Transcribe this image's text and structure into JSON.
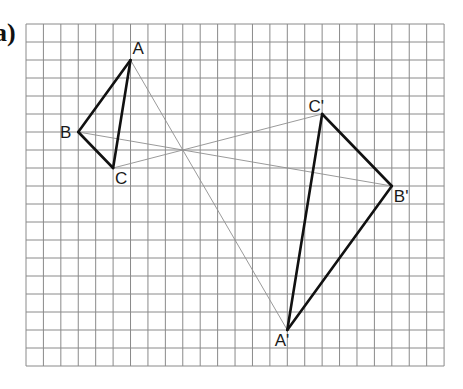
{
  "part_label": "a)",
  "grid": {
    "columns": 24,
    "rows": 19
  },
  "triangles": [
    {
      "name": "object",
      "vertices": [
        {
          "label": "A",
          "x": 6,
          "y": 2,
          "label_pos": "above-right"
        },
        {
          "label": "B",
          "x": 3,
          "y": 6,
          "label_pos": "left"
        },
        {
          "label": "C",
          "x": 5,
          "y": 8,
          "label_pos": "below-right"
        }
      ]
    },
    {
      "name": "image",
      "vertices": [
        {
          "label": "A'",
          "x": 15,
          "y": 17,
          "label_pos": "below-left"
        },
        {
          "label": "B'",
          "x": 21,
          "y": 9,
          "label_pos": "below-right"
        },
        {
          "label": "C'",
          "x": 17,
          "y": 5,
          "label_pos": "above-left"
        }
      ]
    }
  ],
  "construction_lines": [
    {
      "from": "A",
      "to": "A'"
    },
    {
      "from": "B",
      "to": "B'"
    },
    {
      "from": "C",
      "to": "C'"
    }
  ],
  "center_of_enlargement": {
    "x": 9,
    "y": 7
  },
  "scale_factor": -3
}
